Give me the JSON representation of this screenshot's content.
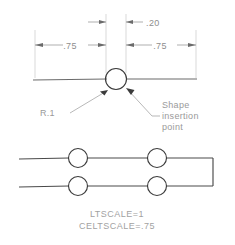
{
  "drawing": {
    "title": "AutoCAD linetype shape definition diagram",
    "colors": {
      "object_line": "#6b6b6b",
      "dimension_line": "#8e8e8e",
      "extension_line": "#c9c9c9",
      "text": "#9a9a9a",
      "shape_outline": "#3b3b3b",
      "background": "#ffffff"
    },
    "top_view": {
      "dimensions": [
        {
          "id": "gap",
          "label": ".20",
          "value": 0.2
        },
        {
          "id": "left-span",
          "label": ".75",
          "value": 0.75
        },
        {
          "id": "right-span",
          "label": ".75",
          "value": 0.75
        }
      ],
      "annotations": [
        {
          "id": "radius",
          "label": "R.1",
          "value": 0.1
        },
        {
          "id": "insertion",
          "lines": [
            "Shape",
            "insertion",
            "point"
          ]
        }
      ]
    },
    "bottom_view": {
      "captions": [
        {
          "id": "ltscale",
          "label": "LTSCALE=1"
        },
        {
          "id": "celtscale",
          "label": "CELTSCALE=.75"
        }
      ],
      "circle_count": 4
    }
  }
}
